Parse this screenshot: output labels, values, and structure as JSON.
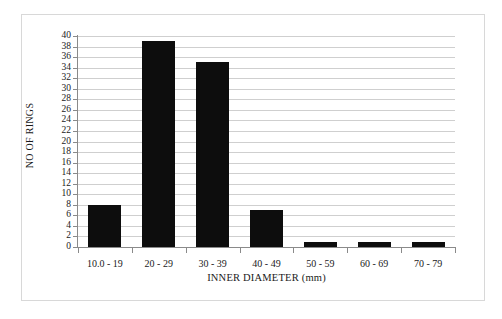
{
  "chart_data": {
    "type": "bar",
    "title": "",
    "xlabel": "INNER DIAMETER (mm)",
    "ylabel": "NO OF RINGS",
    "categories": [
      "10.0 - 19",
      "20 - 29",
      "30 - 39",
      "40 - 49",
      "50 - 59",
      "60 - 69",
      "70 - 79"
    ],
    "values": [
      8,
      39,
      35,
      7,
      1,
      1,
      1
    ],
    "ylim": [
      0,
      40
    ],
    "ytick_step": 2,
    "yticks": [
      0,
      2,
      4,
      6,
      8,
      10,
      12,
      14,
      16,
      18,
      20,
      22,
      24,
      26,
      28,
      30,
      32,
      34,
      36,
      38,
      40
    ],
    "ytick_labels": [
      "0",
      "2",
      "4",
      "6",
      "8",
      "10",
      "12",
      "14",
      "16",
      "18",
      "20",
      "22",
      "24",
      "26",
      "28",
      "30",
      "32",
      "34",
      "36",
      "38",
      "40"
    ],
    "grid": true,
    "grid_axis": "y",
    "legend": false,
    "legend_position": "none",
    "bar_color": "#0d0d0d",
    "grid_color": "#cfcfcf",
    "axis_color": "#8a8a8a",
    "frame_color": "#d8d8d8",
    "background": "#ffffff",
    "series": [
      {
        "name": "NO OF RINGS",
        "values": [
          8,
          39,
          35,
          7,
          1,
          1,
          1
        ]
      }
    ]
  }
}
